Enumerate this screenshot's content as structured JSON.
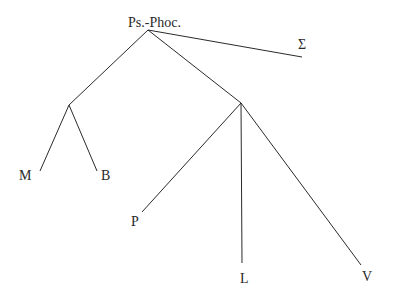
{
  "diagram": {
    "type": "stemma",
    "nodes": {
      "root": {
        "label": "Ps.-Phoc."
      },
      "sigma": {
        "label": "Σ"
      },
      "M": {
        "label": "M"
      },
      "B": {
        "label": "B"
      },
      "P": {
        "label": "P"
      },
      "L": {
        "label": "L"
      },
      "V": {
        "label": "V"
      }
    },
    "edges": [
      [
        "Ps.-Phoc.",
        "Σ"
      ],
      [
        "Ps.-Phoc.",
        "hyparchetype-left"
      ],
      [
        "Ps.-Phoc.",
        "hyparchetype-right"
      ],
      [
        "hyparchetype-left",
        "M"
      ],
      [
        "hyparchetype-left",
        "B"
      ],
      [
        "hyparchetype-right",
        "P"
      ],
      [
        "hyparchetype-right",
        "L"
      ],
      [
        "hyparchetype-right",
        "V"
      ]
    ]
  }
}
